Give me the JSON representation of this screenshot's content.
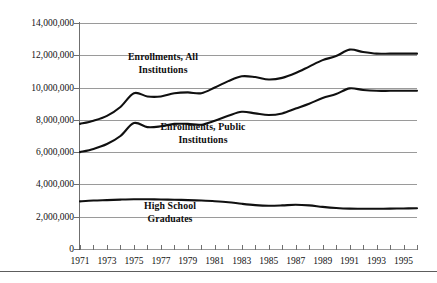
{
  "chart_data": {
    "type": "line",
    "title": "",
    "subtitle": "",
    "xlabel": "",
    "ylabel": "",
    "xlim": [
      1971,
      1996
    ],
    "ylim": [
      0,
      14000000
    ],
    "grid": true,
    "legend_position": "inline-annotations",
    "y_ticks": [
      "14,000,000",
      "12,000,000",
      "10,000,000",
      "8,000,000",
      "6,000,000",
      "4,000,000",
      "2,000,000",
      "0"
    ],
    "y_tick_values": [
      14000000,
      12000000,
      10000000,
      8000000,
      6000000,
      4000000,
      2000000,
      0
    ],
    "x_tick_labels": [
      "1971",
      "1973",
      "1975",
      "1977",
      "1979",
      "1981",
      "1983",
      "1985",
      "1987",
      "1989",
      "1991",
      "1993",
      "1995"
    ],
    "x_tick_values": [
      1971,
      1973,
      1975,
      1977,
      1979,
      1981,
      1983,
      1985,
      1987,
      1989,
      1991,
      1993,
      1995
    ],
    "x": [
      1971,
      1972,
      1973,
      1974,
      1975,
      1976,
      1977,
      1978,
      1979,
      1980,
      1981,
      1982,
      1983,
      1984,
      1985,
      1986,
      1987,
      1988,
      1989,
      1990,
      1991,
      1992,
      1993,
      1994,
      1995,
      1996
    ],
    "series": [
      {
        "name": "Enrollments, All Institutions",
        "values": [
          7750000,
          7950000,
          8250000,
          8800000,
          9650000,
          9450000,
          9450000,
          9650000,
          9700000,
          9650000,
          10000000,
          10400000,
          10700000,
          10650000,
          10500000,
          10600000,
          10900000,
          11300000,
          11700000,
          11950000,
          12350000,
          12200000,
          12100000,
          12100000,
          12100000,
          12100000
        ]
      },
      {
        "name": "Enrollments, Public Institutions",
        "values": [
          6000000,
          6200000,
          6500000,
          7000000,
          7800000,
          7550000,
          7600000,
          7750000,
          7750000,
          7700000,
          7950000,
          8250000,
          8500000,
          8400000,
          8300000,
          8400000,
          8700000,
          9000000,
          9350000,
          9600000,
          9950000,
          9850000,
          9800000,
          9800000,
          9800000,
          9800000
        ]
      },
      {
        "name": "High School Graduates",
        "values": [
          2950000,
          3000000,
          3030000,
          3060000,
          3080000,
          3080000,
          3070000,
          3050000,
          3030000,
          3000000,
          2960000,
          2900000,
          2800000,
          2720000,
          2680000,
          2700000,
          2740000,
          2700000,
          2610000,
          2540000,
          2500000,
          2490000,
          2490000,
          2500000,
          2510000,
          2520000
        ]
      }
    ],
    "annotations": [
      {
        "text_line1": "Enrollments, All",
        "text_line2": "Institutions"
      },
      {
        "text_line1": "Enrollments, Public",
        "text_line2": "Institutions"
      },
      {
        "text_line1": "High School",
        "text_line2": "Graduates"
      }
    ],
    "colors": {
      "line": "#101010",
      "gridline": "#9a9a9a",
      "axis": "#4a4a4a",
      "text": "#111111",
      "background": "#ffffff"
    }
  },
  "caption": {
    "text": ""
  }
}
